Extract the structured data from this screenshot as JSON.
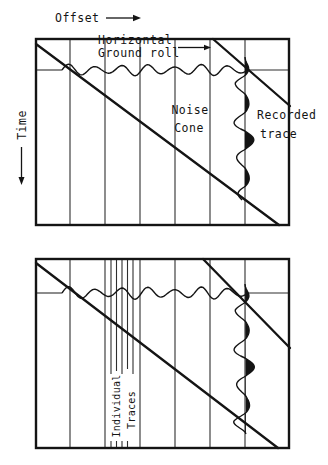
{
  "figure": {
    "background": "#ffffff",
    "ink_color": "#141414",
    "axes": {
      "offset_label": "Offset",
      "time_label": "Time"
    },
    "upper_panel": {
      "ground_roll_label": [
        "Horizontal",
        "Ground roll"
      ],
      "noise_cone_label": [
        "Noise",
        "Cone"
      ],
      "recorded_trace_label": [
        "Recorded",
        "trace"
      ]
    },
    "lower_panel": {
      "individual_traces_label": [
        "Individual",
        "Traces"
      ]
    }
  }
}
